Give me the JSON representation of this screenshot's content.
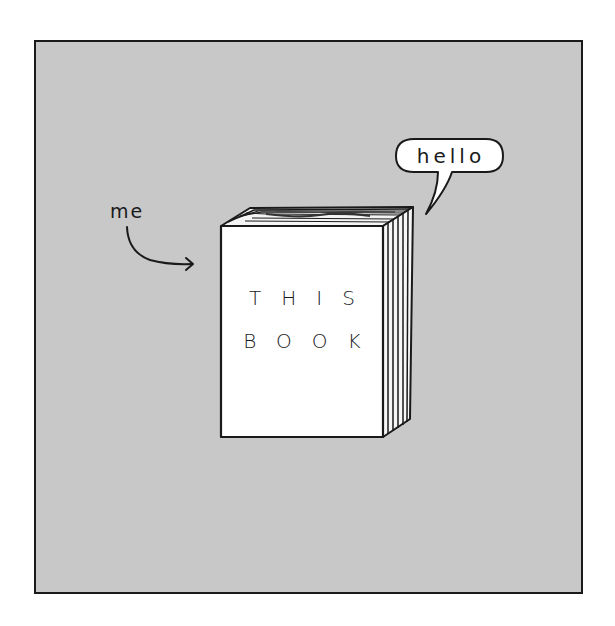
{
  "illustration": {
    "background_color": "#c8c8c8",
    "frame_color": "#1a1a1a",
    "page_color": "#ffffff",
    "label_me": "me",
    "speech_bubble_text": "hello",
    "book": {
      "cover_line_1": "THIS",
      "cover_line_2": "BOOK",
      "cover_color": "#ffffff"
    },
    "icons": {
      "arrow": "curved-arrow-right",
      "bubble": "speech-bubble"
    }
  }
}
